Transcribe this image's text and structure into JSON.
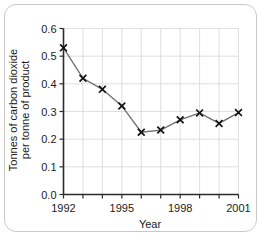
{
  "chart_data": {
    "type": "line",
    "title": "",
    "xlabel": "Year",
    "ylabel": "Tonnes of carbon dioxide per tonne of product",
    "ylabel_line1": "Tonnes of carbon dioxide",
    "ylabel_line2": "per tonne of product",
    "x": [
      1992,
      1993,
      1994,
      1995,
      1996,
      1997,
      1998,
      1999,
      2000,
      2001
    ],
    "values": [
      0.53,
      0.42,
      0.38,
      0.32,
      0.225,
      0.233,
      0.27,
      0.295,
      0.257,
      0.296
    ],
    "xlim": [
      1992,
      2001
    ],
    "ylim": [
      0.0,
      0.6
    ],
    "xticks": [
      1992,
      1993,
      1994,
      1995,
      1996,
      1997,
      1998,
      1999,
      2000,
      2001
    ],
    "xtick_labels": [
      "1992",
      "",
      "",
      "1995",
      "",
      "",
      "1998",
      "",
      "",
      "2001"
    ],
    "yticks": [
      0.0,
      0.1,
      0.2,
      0.3,
      0.4,
      0.5,
      0.6
    ],
    "ytick_labels": [
      "0.0",
      "0.1",
      "0.2",
      "0.3",
      "0.4",
      "0.5",
      "0.6"
    ],
    "grid": true,
    "legend": false,
    "marker": "x",
    "line_color": "#6d6d75",
    "marker_color": "#111111",
    "grid_color": "#d6d6dc",
    "axis_color": "#2b2b2b",
    "frame_color": "#c9c9c9",
    "background": "#ffffff"
  }
}
